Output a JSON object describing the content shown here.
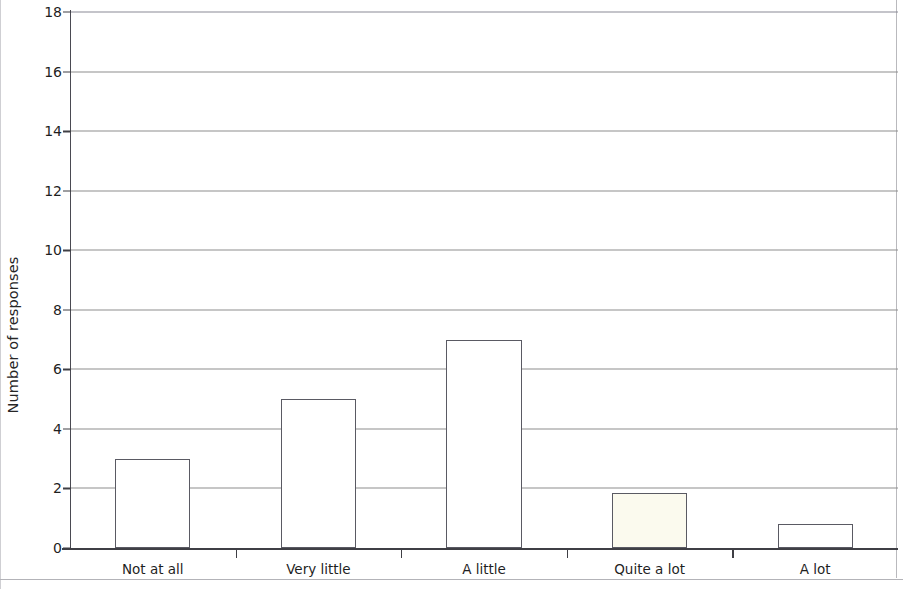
{
  "chart_data": {
    "type": "bar",
    "title": "",
    "subtitle": "",
    "xlabel": "",
    "ylabel": "Number of responses",
    "categories": [
      "Not at all",
      "Very little",
      "A little",
      "Quite a lot",
      "A lot"
    ],
    "values": [
      3,
      5,
      7,
      1.85,
      0.8
    ],
    "series": [
      {
        "name": "Number of responses",
        "values": [
          3,
          5,
          7,
          1.85,
          0.8
        ]
      }
    ],
    "ylim": [
      0,
      18
    ],
    "y_ticks": [
      0,
      2,
      4,
      6,
      8,
      10,
      12,
      14,
      16,
      18
    ],
    "y_tick_labels": [
      "0",
      "2",
      "4",
      "6",
      "8",
      "10",
      "12",
      "14",
      "16",
      "18"
    ],
    "grid": "horizontal",
    "legend": "none",
    "legend_position": "",
    "bar_fill_color": "#ffffff",
    "bar_edge_color": "#5a5a63",
    "gridline_color": "#8d8d8d",
    "axis_color": "#3f3f45",
    "background_color": "#ffffff",
    "annotations": []
  }
}
